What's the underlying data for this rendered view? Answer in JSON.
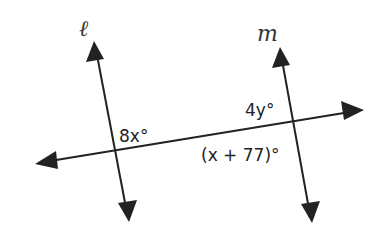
{
  "diagram": {
    "colors": {
      "line": "#222222",
      "background": "#ffffff"
    },
    "lines": {
      "l": {
        "label": "ℓ"
      },
      "m": {
        "label": "m"
      },
      "transversal": {
        "label": ""
      }
    },
    "angles": {
      "at_l": "8x°",
      "at_m_upper": "4y°",
      "at_m_lower": "(x + 77)°"
    }
  }
}
